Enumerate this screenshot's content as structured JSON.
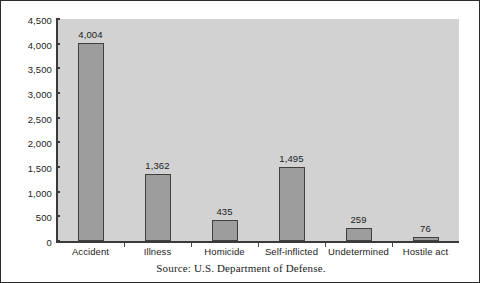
{
  "chart_data": {
    "type": "bar",
    "title": "",
    "xlabel": "",
    "ylabel": "",
    "categories": [
      "Accident",
      "Illness",
      "Homicide",
      "Self-inflicted",
      "Undetermined",
      "Hostile act"
    ],
    "values": [
      4004,
      1362,
      435,
      1495,
      259,
      76
    ],
    "value_labels": [
      "4,004",
      "1,362",
      "435",
      "1,495",
      "259",
      "76"
    ],
    "ylim": [
      0,
      4500
    ],
    "ytick_values": [
      0,
      500,
      1000,
      1500,
      2000,
      2500,
      3000,
      3500,
      4000,
      4500
    ],
    "ytick_labels": [
      "0",
      "500",
      "1,000",
      "1,500",
      "2,000",
      "2,500",
      "3,000",
      "3,500",
      "4,000",
      "4,500"
    ],
    "grid": false,
    "legend": "none",
    "series": [
      {
        "name": "Deaths",
        "values": [
          4004,
          1362,
          435,
          1495,
          259,
          76
        ]
      }
    ],
    "colors": {
      "bar_fill": "#9d9d9d",
      "bar_edge": "#404040",
      "plot_background": "#d2d2d2",
      "figure_background": "#ffffff",
      "axis": "#3a3a3a",
      "text": "#1b1b1b",
      "frame": "#2a2a2a"
    }
  },
  "source": {
    "note": "Source: U.S. Department of Defense."
  }
}
